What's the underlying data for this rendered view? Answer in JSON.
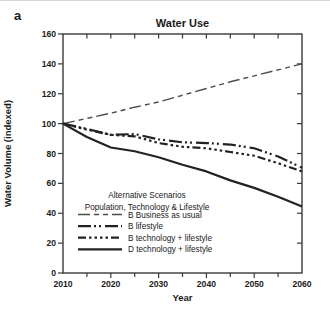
{
  "panel_label": "a",
  "chart_data": {
    "type": "line",
    "title": "Water Use",
    "xlabel": "Year",
    "ylabel": "Water Volume (indexed)",
    "xlim": [
      2010,
      2060
    ],
    "ylim": [
      0,
      160
    ],
    "x_major_ticks": [
      2010,
      2020,
      2030,
      2040,
      2050,
      2060
    ],
    "x_minor_step": 5,
    "y_ticks": [
      0,
      20,
      40,
      60,
      80,
      100,
      120,
      140,
      160
    ],
    "grid": false,
    "legend": {
      "position": "inside-lower-left",
      "title_line1": "Alternative Scenarios",
      "title_line2": "Population, Technology & Lifestyle"
    },
    "x": [
      2010,
      2015,
      2020,
      2025,
      2030,
      2035,
      2040,
      2045,
      2050,
      2055,
      2060
    ],
    "series": [
      {
        "name": "B Business as usual",
        "line_style": "long-dash-short-dash",
        "dash": [
          12,
          4,
          5,
          4,
          5,
          4
        ],
        "width": 1.4,
        "color": "#4d4d4d",
        "values": [
          100,
          103.5,
          107,
          111,
          114.5,
          119,
          123.5,
          128,
          132,
          136,
          140
        ]
      },
      {
        "name": "B lifestyle",
        "line_style": "dash-dot-dot",
        "dash": [
          13,
          3,
          2,
          3,
          2,
          4
        ],
        "width": 2.2,
        "color": "#222222",
        "values": [
          100,
          96.5,
          92.5,
          93,
          89.5,
          87.5,
          87,
          86,
          83.5,
          78,
          70.5
        ]
      },
      {
        "name": "B technology + lifestyle",
        "line_style": "dash-dot-dot-dot",
        "dash": [
          8,
          3,
          2.5,
          3,
          2.5,
          3,
          2.5,
          3,
          2.5,
          3
        ],
        "width": 2.2,
        "color": "#222222",
        "values": [
          100,
          96,
          92.5,
          91.5,
          87,
          84.5,
          83.5,
          81,
          78.5,
          73.5,
          68
        ]
      },
      {
        "name": "D technology + lifestyle",
        "line_style": "solid",
        "dash": [],
        "width": 2.2,
        "color": "#222222",
        "values": [
          100,
          91,
          84,
          81.5,
          77.5,
          72.5,
          68,
          62,
          57,
          51,
          44.5
        ]
      }
    ],
    "colors": {
      "axis": "#3a3a3a",
      "text": "#1a1a1a",
      "background": "#ffffff"
    }
  }
}
